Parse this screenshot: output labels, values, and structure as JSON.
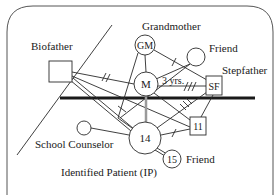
{
  "diagram": {
    "type": "ecomap",
    "colors": {
      "line": "#2a2a2a",
      "thick_line": "#1a1a1a",
      "gray_line": "#9a9a9a",
      "background": "#ffffff"
    },
    "labels": {
      "biofather": "Biofather",
      "grandmother": "Grandmother",
      "friend_top": "Friend",
      "stepfather": "Stepfather",
      "school_counselor": "School Counselor",
      "friend_bottom": "Friend",
      "identified_patient": "Identified Patient (IP)",
      "duration": "3 yrs."
    },
    "nodes": {
      "gm": "GM",
      "m": "M",
      "sf": "SF",
      "eleven": "11",
      "fourteen": "14",
      "fifteen": "15"
    }
  }
}
